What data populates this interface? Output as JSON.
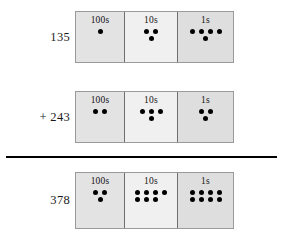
{
  "worksheet": {
    "title": "place-value addition with dots",
    "rule_color": "#000000",
    "dot_color": "#000000",
    "columns": [
      "100s",
      "10s",
      "1s"
    ],
    "rows": [
      {
        "label": "135",
        "role": "addend",
        "cells": [
          {
            "place": "100s",
            "count": 1,
            "rows_of_dots": [
              1
            ]
          },
          {
            "place": "10s",
            "count": 3,
            "rows_of_dots": [
              3
            ]
          },
          {
            "place": "1s",
            "count": 5,
            "rows_of_dots": [
              5
            ]
          }
        ]
      },
      {
        "label": "+ 243",
        "role": "addend",
        "cells": [
          {
            "place": "100s",
            "count": 2,
            "rows_of_dots": [
              2
            ]
          },
          {
            "place": "10s",
            "count": 4,
            "rows_of_dots": [
              4
            ]
          },
          {
            "place": "1s",
            "count": 3,
            "rows_of_dots": [
              3
            ]
          }
        ]
      },
      {
        "label": "378",
        "role": "sum",
        "cells": [
          {
            "place": "100s",
            "count": 3,
            "rows_of_dots": [
              3
            ]
          },
          {
            "place": "10s",
            "count": 7,
            "rows_of_dots": [
              5,
              2
            ]
          },
          {
            "place": "1s",
            "count": 8,
            "rows_of_dots": [
              5,
              3
            ]
          }
        ]
      }
    ]
  }
}
